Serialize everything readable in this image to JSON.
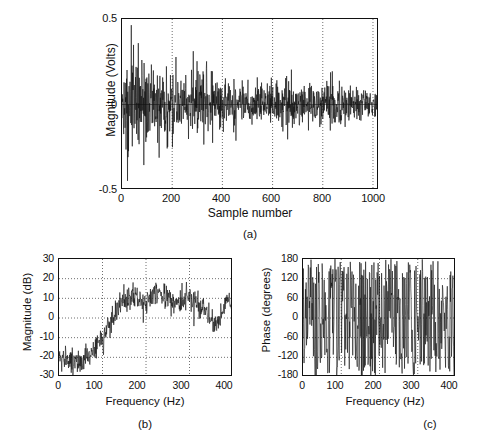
{
  "figure": {
    "background": "#ffffff",
    "line_color": "#101010",
    "grid_color": "#555555",
    "axis_color": "#111111"
  },
  "captions": {
    "a": "(a)",
    "b": "(b)",
    "c": "(c)"
  },
  "chart_data": [
    {
      "id": "a",
      "type": "line",
      "title": "",
      "xlabel": "Sample number",
      "ylabel": "Magnitude (Volts)",
      "xlim": [
        0,
        1024
      ],
      "ylim": [
        -0.5,
        0.5
      ],
      "xticks": [
        0,
        200,
        400,
        600,
        800,
        1000
      ],
      "xticklabels": [
        "0",
        "200",
        "400",
        "600",
        "800",
        "1000"
      ],
      "yticks": [
        -0.5,
        0,
        0.5
      ],
      "yticklabels": [
        "-0.5",
        "0",
        "0.5"
      ],
      "grid": "vertical-dotted",
      "zero_line": true,
      "legend": "none",
      "description": "Random noise-like time series, amplitude envelope decaying from about +/-0.40 V near sample 40 to about +/-0.08 V near sample 1000",
      "envelope_points": [
        {
          "x": 0,
          "a": 0.12
        },
        {
          "x": 30,
          "a": 0.4
        },
        {
          "x": 60,
          "a": 0.34
        },
        {
          "x": 100,
          "a": 0.26
        },
        {
          "x": 150,
          "a": 0.22
        },
        {
          "x": 200,
          "a": 0.2
        },
        {
          "x": 260,
          "a": 0.17
        },
        {
          "x": 320,
          "a": 0.24
        },
        {
          "x": 380,
          "a": 0.19
        },
        {
          "x": 450,
          "a": 0.15
        },
        {
          "x": 520,
          "a": 0.13
        },
        {
          "x": 600,
          "a": 0.12
        },
        {
          "x": 650,
          "a": 0.19
        },
        {
          "x": 720,
          "a": 0.12
        },
        {
          "x": 800,
          "a": 0.11
        },
        {
          "x": 840,
          "a": 0.18
        },
        {
          "x": 900,
          "a": 0.11
        },
        {
          "x": 1000,
          "a": 0.09
        },
        {
          "x": 1024,
          "a": 0.08
        }
      ],
      "seed": 20231
    },
    {
      "id": "b",
      "type": "line",
      "title": "",
      "xlabel": "Frequency (Hz)",
      "ylabel": "Magnitude (dB)",
      "xlim": [
        0,
        400
      ],
      "ylim": [
        -30,
        30
      ],
      "xticks": [
        0,
        100,
        200,
        300,
        400
      ],
      "xticklabels": [
        "0",
        "100",
        "200",
        "300",
        "400"
      ],
      "yticks": [
        -30,
        -20,
        -10,
        0,
        10,
        20,
        30
      ],
      "yticklabels": [
        "-30",
        "-20",
        "-10",
        "0",
        "10",
        "20",
        "30"
      ],
      "grid": "both-dotted",
      "legend": "none",
      "description": "Spectrum magnitude: flat noise floor near -20 dB below 60 Hz, steep rise between 60 and 140 Hz, plateau near +10 dB from 150 to 330 Hz with peaks to +24 dB, falling toward 0 dB near 360 Hz then rising again to +17 dB at 390 Hz",
      "trend_points": [
        {
          "x": 0,
          "y": -20
        },
        {
          "x": 20,
          "y": -21
        },
        {
          "x": 40,
          "y": -21
        },
        {
          "x": 55,
          "y": -21
        },
        {
          "x": 70,
          "y": -17
        },
        {
          "x": 85,
          "y": -13
        },
        {
          "x": 100,
          "y": -9
        },
        {
          "x": 115,
          "y": -2
        },
        {
          "x": 130,
          "y": 4
        },
        {
          "x": 145,
          "y": 9
        },
        {
          "x": 160,
          "y": 11
        },
        {
          "x": 175,
          "y": 12
        },
        {
          "x": 190,
          "y": 9
        },
        {
          "x": 205,
          "y": 10
        },
        {
          "x": 220,
          "y": 14
        },
        {
          "x": 235,
          "y": 12
        },
        {
          "x": 250,
          "y": 10
        },
        {
          "x": 265,
          "y": 9
        },
        {
          "x": 280,
          "y": 9
        },
        {
          "x": 295,
          "y": 13
        },
        {
          "x": 305,
          "y": 12
        },
        {
          "x": 320,
          "y": 8
        },
        {
          "x": 335,
          "y": 4
        },
        {
          "x": 350,
          "y": 1
        },
        {
          "x": 365,
          "y": -3
        },
        {
          "x": 378,
          "y": 8
        },
        {
          "x": 390,
          "y": 13
        },
        {
          "x": 400,
          "y": 5
        }
      ],
      "noise_amplitude": 5.5,
      "seed": 7741
    },
    {
      "id": "c",
      "type": "line",
      "title": "",
      "xlabel": "Frequency (Hz)",
      "ylabel": "Phase (degrees)",
      "xlim": [
        0,
        400
      ],
      "ylim": [
        -180,
        180
      ],
      "xticks": [
        0,
        100,
        200,
        300,
        400
      ],
      "xticklabels": [
        "0",
        "100",
        "200",
        "300",
        "400"
      ],
      "yticks": [
        -180,
        -120,
        -60,
        0,
        60,
        120,
        180
      ],
      "yticklabels": [
        "-180",
        "-120",
        "-60",
        "0",
        "60",
        "120",
        "180"
      ],
      "grid": "both-dotted",
      "legend": "none",
      "description": "Wrapped phase spectrum, values filling the full -180 to 180 degree range in rapid random jumps across all frequencies",
      "noise_amplitude": 180,
      "seed": 3312
    }
  ]
}
